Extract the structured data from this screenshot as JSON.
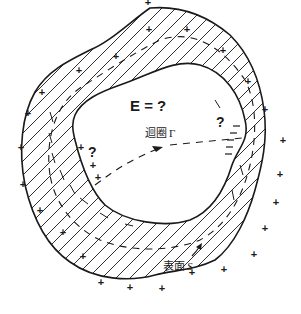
{
  "diagram": {
    "title": "E = ?",
    "question_marks": [
      "?",
      "?"
    ],
    "loop_label": "迴圈",
    "loop_symbol": "Γ",
    "surface_label": "表面",
    "surface_symbol": "S",
    "charge_sign": "+",
    "colors": {
      "ink": "#1a1a1a",
      "background": "#ffffff"
    }
  }
}
